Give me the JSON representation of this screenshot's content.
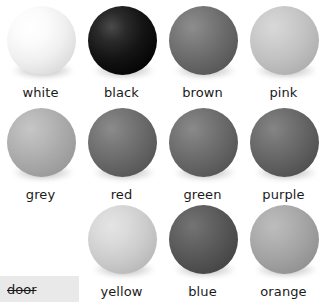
{
  "background_color": "#ffffff",
  "grid": {
    "columns": 4,
    "rows": 3,
    "cells": [
      {
        "label": "white",
        "shape": "sphere",
        "tone": "#f0f0f0",
        "row": 1,
        "col": 1
      },
      {
        "label": "black",
        "shape": "sphere",
        "tone": "#141414",
        "row": 1,
        "col": 2
      },
      {
        "label": "brown",
        "shape": "sphere",
        "tone": "#6a6a6a",
        "row": 1,
        "col": 3
      },
      {
        "label": "pink",
        "shape": "sphere",
        "tone": "#c0c0c0",
        "row": 1,
        "col": 4
      },
      {
        "label": "grey",
        "shape": "sphere",
        "tone": "#a9a9a9",
        "row": 2,
        "col": 1
      },
      {
        "label": "red",
        "shape": "sphere",
        "tone": "#696969",
        "row": 2,
        "col": 2
      },
      {
        "label": "green",
        "shape": "sphere",
        "tone": "#686868",
        "row": 2,
        "col": 3
      },
      {
        "label": "purple",
        "shape": "sphere",
        "tone": "#636363",
        "row": 2,
        "col": 4
      },
      {
        "label": "yellow",
        "shape": "sphere",
        "tone": "#cccccc",
        "row": 3,
        "col": 2
      },
      {
        "label": "blue",
        "shape": "sphere",
        "tone": "#565656",
        "row": 3,
        "col": 3
      },
      {
        "label": "orange",
        "shape": "sphere",
        "tone": "#a2a2a2",
        "row": 3,
        "col": 4
      }
    ]
  },
  "word_chip": {
    "text": "door",
    "struck_through": true,
    "background_color": "#e9e9e9",
    "text_color": "#1a1a1a"
  }
}
